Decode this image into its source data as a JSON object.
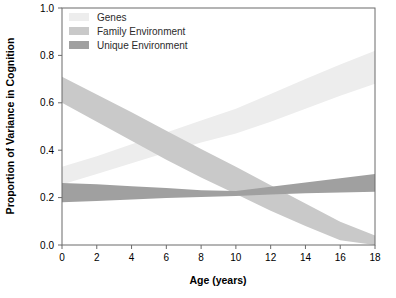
{
  "chart_data": {
    "type": "area",
    "title": "",
    "subtitle": "",
    "xlabel": "Age (years)",
    "ylabel": "Proportion of Variance in Cognition",
    "xlim": [
      0,
      18
    ],
    "ylim": [
      0,
      1.0
    ],
    "xticks": [
      0,
      2,
      4,
      6,
      8,
      10,
      12,
      14,
      16,
      18
    ],
    "xtick_labels": [
      "0",
      "2",
      "4",
      "6",
      "8",
      "10",
      "12",
      "14",
      "16",
      "18"
    ],
    "yticks": [
      0.0,
      0.2,
      0.4,
      0.6,
      0.8,
      1.0
    ],
    "ytick_labels": [
      "0.0",
      "0.2",
      "0.4",
      "0.6",
      "0.8",
      "1.0"
    ],
    "grid": false,
    "legend_position": "top-left-inside",
    "band_style": "confidence-ribbon",
    "series": [
      {
        "name": "Genes",
        "color": "#ededed",
        "x": [
          0,
          2,
          4,
          6,
          8,
          10,
          12,
          14,
          16,
          18
        ],
        "lower": [
          0.255,
          0.3,
          0.345,
          0.39,
          0.432,
          0.47,
          0.52,
          0.575,
          0.63,
          0.68
        ],
        "upper": [
          0.33,
          0.375,
          0.425,
          0.475,
          0.525,
          0.575,
          0.637,
          0.7,
          0.762,
          0.82
        ],
        "values": [
          0.293,
          0.338,
          0.385,
          0.433,
          0.479,
          0.523,
          0.579,
          0.638,
          0.696,
          0.75
        ]
      },
      {
        "name": "Family Environment",
        "color": "#c9c9c9",
        "x": [
          0,
          2,
          4,
          6,
          8,
          10,
          12,
          14,
          16,
          18
        ],
        "lower": [
          0.6,
          0.52,
          0.44,
          0.36,
          0.285,
          0.215,
          0.145,
          0.08,
          0.02,
          0.0
        ],
        "upper": [
          0.71,
          0.635,
          0.56,
          0.482,
          0.405,
          0.33,
          0.252,
          0.175,
          0.098,
          0.04
        ],
        "values": [
          0.655,
          0.578,
          0.5,
          0.421,
          0.345,
          0.273,
          0.199,
          0.128,
          0.059,
          0.02
        ]
      },
      {
        "name": "Unique Environment",
        "color": "#a0a0a0",
        "x": [
          0,
          2,
          4,
          6,
          8,
          10,
          12,
          14,
          16,
          18
        ],
        "lower": [
          0.18,
          0.186,
          0.192,
          0.198,
          0.203,
          0.207,
          0.213,
          0.218,
          0.222,
          0.225
        ],
        "upper": [
          0.262,
          0.256,
          0.248,
          0.24,
          0.231,
          0.228,
          0.246,
          0.264,
          0.282,
          0.3
        ],
        "values": [
          0.221,
          0.221,
          0.22,
          0.219,
          0.217,
          0.218,
          0.23,
          0.241,
          0.252,
          0.263
        ]
      }
    ]
  },
  "legend": {
    "items": [
      {
        "label": "Genes",
        "color": "#ededed"
      },
      {
        "label": "Family Environment",
        "color": "#c9c9c9"
      },
      {
        "label": "Unique Environment",
        "color": "#a0a0a0"
      }
    ]
  },
  "axes": {
    "x_title": "Age (years)",
    "y_title": "Proportion of Variance in Cognition"
  },
  "style": {
    "frame_color": "#6b6b6b",
    "background": "#ffffff",
    "text_color": "#000000"
  }
}
